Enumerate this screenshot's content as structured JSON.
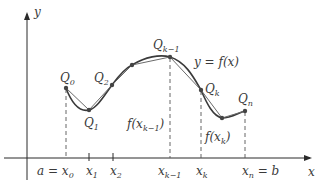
{
  "figure": {
    "curve_label": "y = f(x)",
    "axes": {
      "x_label": "x",
      "y_label": "y"
    },
    "points": [
      {
        "name": "Q",
        "sub": "0"
      },
      {
        "name": "Q",
        "sub": "1"
      },
      {
        "name": "Q",
        "sub": "2"
      },
      {
        "name": "Q",
        "sub": "k−1"
      },
      {
        "name": "Q",
        "sub": "k"
      },
      {
        "name": "Q",
        "sub": "n"
      }
    ],
    "x_ticks": [
      {
        "prefix": "a = ",
        "name": "x",
        "sub": "0"
      },
      {
        "name": "x",
        "sub": "1"
      },
      {
        "name": "x",
        "sub": "2"
      },
      {
        "name": "x",
        "sub": "k−1"
      },
      {
        "name": "x",
        "sub": "k"
      },
      {
        "name": "x",
        "sub": "n",
        "suffix": " = b"
      }
    ],
    "height_labels": [
      {
        "fn": "f(x",
        "sub": "k−1",
        "close": ")"
      },
      {
        "fn": "f(x",
        "sub": "k",
        "close": ")"
      }
    ],
    "colors": {
      "axis": "#2a2a2a",
      "curve": "#3a3a3a",
      "chord": "#6a6a6a",
      "dashed": "#555555",
      "text": "#3a3a3a"
    }
  }
}
